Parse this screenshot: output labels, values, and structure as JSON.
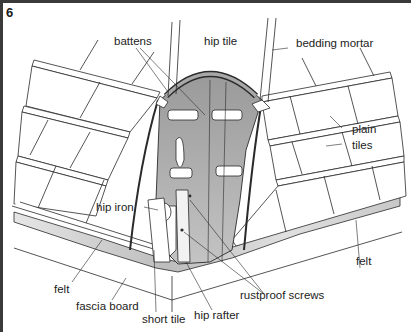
{
  "figure": {
    "number": "6"
  },
  "labels": {
    "battens": "battens",
    "hip_tile": "hip tile",
    "bedding_mortar": "bedding mortar",
    "plain_tiles_line1": "plain",
    "plain_tiles_line2": "tiles",
    "hip_iron": "hip iron",
    "felt_left": "felt",
    "felt_right": "felt",
    "fascia_board": "fascia board",
    "short_tile": "short tile",
    "hip_rafter": "hip rafter",
    "rustproof_screws": "rustproof screws"
  },
  "colors": {
    "line": "#2a2a2a",
    "shade": "#b8b8b8",
    "shade_dark": "#8e8e8e",
    "felt": "#c9c9c9",
    "border": "#3a3a3a"
  }
}
